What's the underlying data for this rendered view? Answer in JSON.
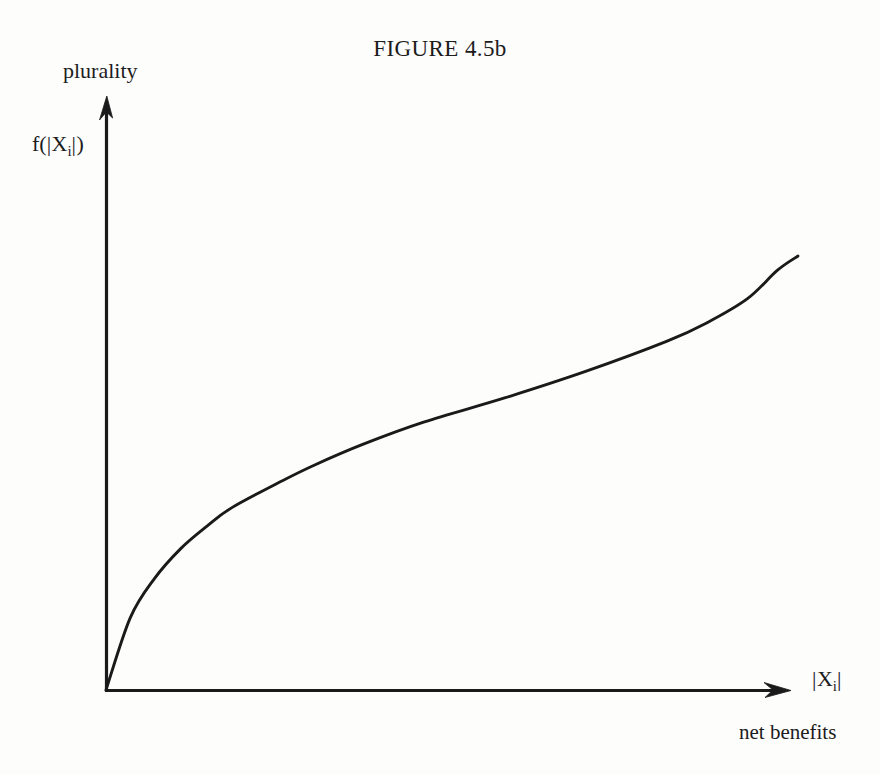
{
  "figure": {
    "title": "FIGURE 4.5b",
    "background_color": "#fdfdfc",
    "ink_color": "#1a1a1a"
  },
  "labels": {
    "y_axis_top": "plurality",
    "y_axis_function_prefix": "f(",
    "y_axis_function_bar_open": "|",
    "y_axis_function_var": "X",
    "y_axis_function_sub": "i",
    "y_axis_function_bar_close": "|",
    "y_axis_function_suffix": ")",
    "x_axis_bar_open": "|",
    "x_axis_var": "X",
    "x_axis_sub": "i",
    "x_axis_bar_close": "|",
    "x_axis_desc": "net benefits"
  },
  "chart_data": {
    "type": "line",
    "title": "FIGURE 4.5b",
    "xlabel": "|Xi|  net benefits",
    "ylabel": "f(|Xi|)  plurality",
    "grid": false,
    "legend": false,
    "axis_style": "arrow-terminated open axes, no tick marks, no tick labels",
    "xlim": [
      0,
      1
    ],
    "ylim": [
      0,
      1
    ],
    "series": [
      {
        "name": "f(|Xi|)",
        "color": "#1a1a1a",
        "x": [
          0.0,
          0.035,
          0.07,
          0.108,
          0.146,
          0.182,
          0.254,
          0.3,
          0.37,
          0.459,
          0.576,
          0.693,
          0.81,
          0.868,
          0.927,
          0.97,
          1.0
        ],
        "y": [
          0.0,
          0.125,
          0.193,
          0.245,
          0.284,
          0.316,
          0.362,
          0.389,
          0.425,
          0.464,
          0.506,
          0.552,
          0.604,
          0.636,
          0.678,
          0.727,
          0.752
        ]
      }
    ],
    "pixel_anchors": {
      "origin": [
        106,
        690
      ],
      "x_axis_end": [
        790,
        690
      ],
      "y_axis_top": [
        106,
        95
      ],
      "curve_end": [
        798,
        256
      ]
    }
  }
}
